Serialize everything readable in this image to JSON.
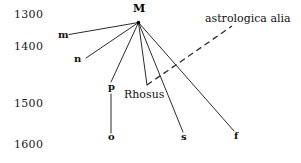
{
  "figure": {
    "type": "stemma-diagram",
    "background_color": "#ffffff",
    "ink_color": "#2b2b2b"
  },
  "axis": {
    "name": "year-scale",
    "ticks": [
      {
        "label": "1300",
        "x": 14,
        "y": 18
      },
      {
        "label": "1400",
        "x": 14,
        "y": 50
      },
      {
        "label": "1500",
        "x": 14,
        "y": 107
      },
      {
        "label": "1600",
        "x": 14,
        "y": 148
      }
    ]
  },
  "root": {
    "id": "M",
    "label": "M",
    "label_x": 133,
    "label_y": 12,
    "point_x": 138.5,
    "point_y": 22.5
  },
  "nodes": [
    {
      "id": "m",
      "label": "m",
      "label_x": 58,
      "label_y": 38,
      "point_x": 69,
      "point_y": 34.5
    },
    {
      "id": "n",
      "label": "n",
      "label_x": 74,
      "label_y": 62,
      "point_x": 86,
      "point_y": 58
    },
    {
      "id": "p",
      "label": "p",
      "label_x": 108,
      "label_y": 90,
      "point_x": 111,
      "point_y": 82
    },
    {
      "id": "o",
      "label": "o",
      "label_x": 108,
      "label_y": 140,
      "point_x": 111,
      "point_y": 133
    },
    {
      "id": "s",
      "label": "s",
      "label_x": 181,
      "label_y": 140,
      "point_x": 183,
      "point_y": 132
    },
    {
      "id": "f",
      "label": "f",
      "label_x": 234,
      "label_y": 139,
      "point_x": 234,
      "point_y": 131
    }
  ],
  "branches": [
    {
      "name": "branch-M-m",
      "from": "M",
      "to": "m",
      "x1": 138.5,
      "y1": 22.5,
      "x2": 69,
      "y2": 34.5,
      "style": "solid"
    },
    {
      "name": "branch-M-n",
      "from": "M",
      "to": "n",
      "x1": 138.5,
      "y1": 22.5,
      "x2": 86,
      "y2": 58,
      "style": "solid"
    },
    {
      "name": "branch-M-p",
      "from": "M",
      "to": "p",
      "x1": 138.5,
      "y1": 22.5,
      "x2": 111,
      "y2": 82,
      "style": "solid"
    },
    {
      "name": "branch-p-o",
      "from": "p",
      "to": "o",
      "x1": 111,
      "y1": 94,
      "x2": 111,
      "y2": 133,
      "style": "solid"
    },
    {
      "name": "branch-M-rhosus",
      "from": "M",
      "to": "Rhosus",
      "x1": 138.5,
      "y1": 22.5,
      "x2": 147,
      "y2": 85,
      "style": "solid"
    },
    {
      "name": "branch-M-s",
      "from": "M",
      "to": "s",
      "x1": 138.5,
      "y1": 22.5,
      "x2": 183,
      "y2": 132,
      "style": "solid"
    },
    {
      "name": "branch-M-f",
      "from": "M",
      "to": "f",
      "x1": 138.5,
      "y1": 22.5,
      "x2": 234,
      "y2": 131,
      "style": "solid"
    },
    {
      "name": "branch-astrologica-alia",
      "from": "Rhosus",
      "to": "astrologica alia",
      "x1": 147,
      "y1": 85,
      "x2": 232,
      "y2": 26,
      "style": "dashed"
    }
  ],
  "annotations": [
    {
      "id": "rhosus",
      "label": "Rhosus",
      "x": 124,
      "y": 98
    },
    {
      "id": "astrologica-alia",
      "label": "astrologica alia",
      "x": 205,
      "y": 22
    }
  ]
}
